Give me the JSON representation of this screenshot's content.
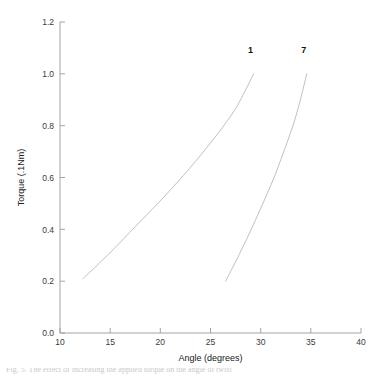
{
  "chart_data": {
    "type": "line",
    "title": "",
    "xlabel": "Angle (degrees)",
    "ylabel": "Torque (.1Nm)",
    "xlim": [
      10,
      40
    ],
    "ylim": [
      0.0,
      1.2
    ],
    "xticks": [
      10,
      15,
      20,
      25,
      30,
      35,
      40
    ],
    "xtick_labels": [
      "10",
      "15",
      "20",
      "25",
      "30",
      "35",
      "40"
    ],
    "yticks": [
      0.0,
      0.2,
      0.4,
      0.6,
      0.8,
      1.0,
      1.2
    ],
    "ytick_labels": [
      "0.0",
      "0.2",
      "0.4",
      "0.6",
      "0.8",
      "1.0",
      "1.2"
    ],
    "grid": false,
    "legend_position": "inline-endpoint-labels",
    "series": [
      {
        "name": "1",
        "label": "1",
        "color": "#b9b9bd",
        "label_x": 29.0,
        "label_y": 1.08,
        "x": [
          12.3,
          13.2,
          14.2,
          15.3,
          16.4,
          17.5,
          18.7,
          19.9,
          21.1,
          22.3,
          23.5,
          24.6,
          25.7,
          26.7,
          27.6,
          28.5,
          29.3
        ],
        "y": [
          0.21,
          0.243,
          0.28,
          0.322,
          0.366,
          0.41,
          0.458,
          0.506,
          0.556,
          0.608,
          0.662,
          0.714,
          0.768,
          0.82,
          0.872,
          0.938,
          1.0
        ]
      },
      {
        "name": "7",
        "label": "7",
        "color": "#b9b9bd",
        "label_x": 34.3,
        "label_y": 1.08,
        "x": [
          26.5,
          27.2,
          27.9,
          28.6,
          29.3,
          30.0,
          30.7,
          31.4,
          32.0,
          32.6,
          33.2,
          33.7,
          34.15,
          34.6
        ],
        "y": [
          0.2,
          0.252,
          0.306,
          0.362,
          0.42,
          0.48,
          0.542,
          0.606,
          0.668,
          0.732,
          0.798,
          0.862,
          0.93,
          1.0
        ]
      }
    ]
  },
  "figure": {
    "background_color": "#ffffff",
    "axis_color": "#9a9a9a",
    "curve_color": "#b9b9bd",
    "caption_partial": "Fig. 5.  The effect of increasing the applied torque on the angle of twist"
  }
}
